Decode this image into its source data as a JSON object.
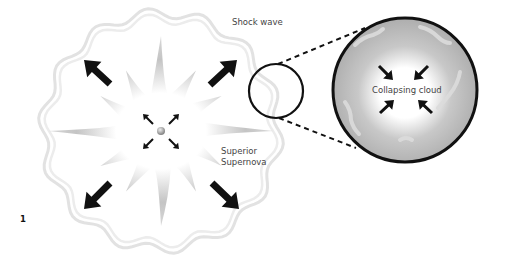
{
  "figure": {
    "number": "1",
    "labels": {
      "shock_wave": "Shock wave",
      "superior_supernova_line1": "Superior",
      "superior_supernova_line2": "Supernova",
      "collapsing_cloud": "Collapsing cloud"
    },
    "colors": {
      "outline": "#111111",
      "burst_gray": "#b8b8b8",
      "cloud_gray": "#b5b5b5",
      "shock_wave": "#e6e6e6"
    }
  }
}
